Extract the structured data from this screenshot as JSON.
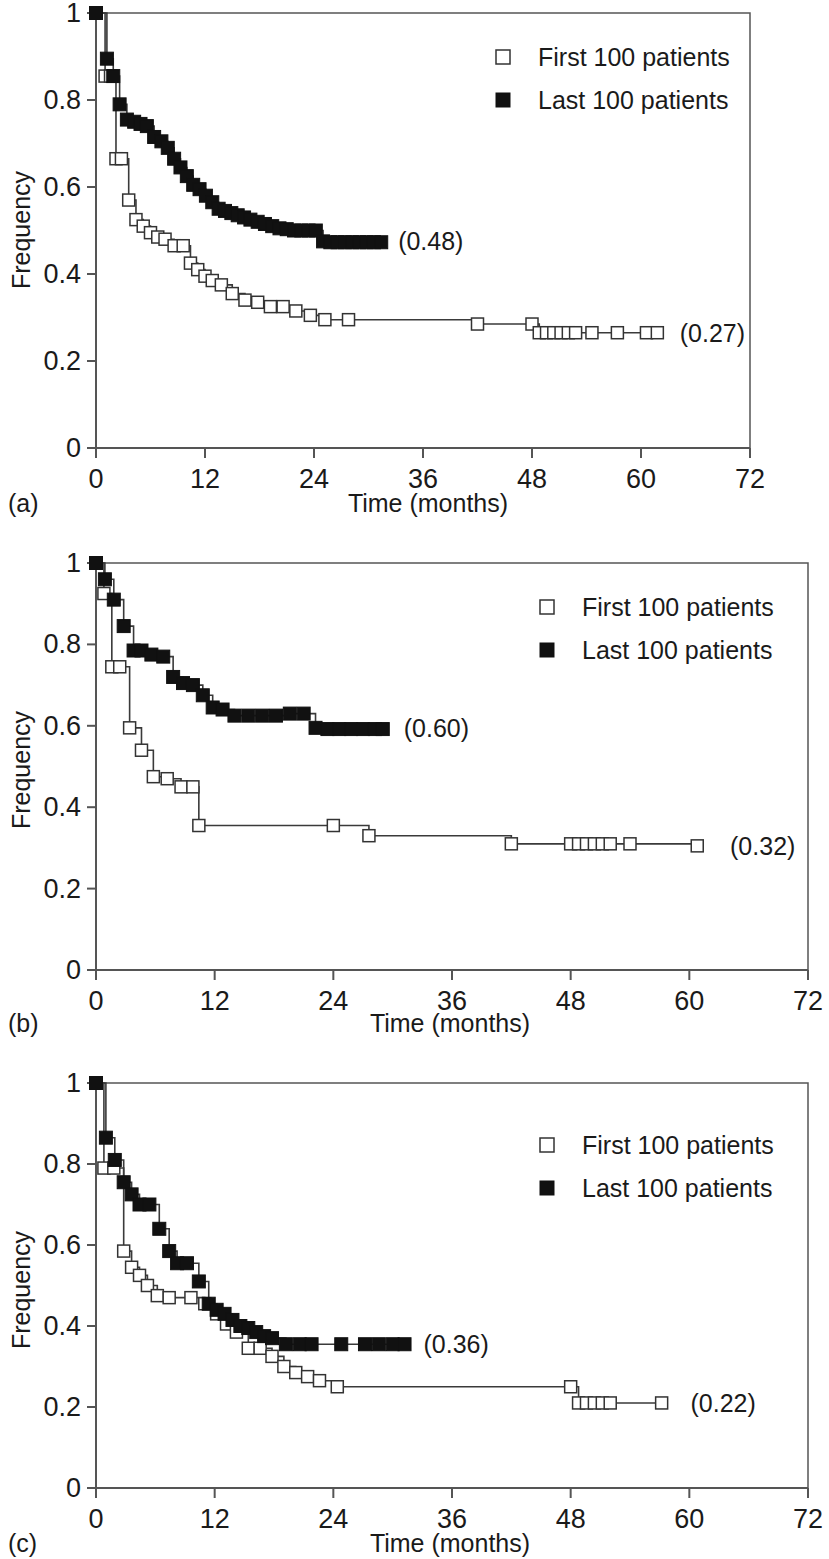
{
  "figure": {
    "type": "kaplan-meier-survival-curves",
    "panel_count": 3
  },
  "common": {
    "ylabel": "Frequency",
    "xlabel": "Time (months)",
    "yticks": [
      "0",
      "0.2",
      "0.4",
      "0.6",
      "0.8",
      "1"
    ],
    "ytick_values": [
      0,
      0.2,
      0.4,
      0.6,
      0.8,
      1
    ],
    "xticks": [
      "0",
      "12",
      "24",
      "36",
      "48",
      "60",
      "72"
    ],
    "xtick_values": [
      0,
      12,
      24,
      36,
      48,
      60,
      72
    ],
    "legend": [
      {
        "label": "First 100 patients",
        "marker": "open-square",
        "color": "#ffffff"
      },
      {
        "label": "Last 100 patients",
        "marker": "filled-square",
        "color": "#111111"
      }
    ],
    "grid": false,
    "legend_position": "top-right"
  },
  "chart_data": [
    {
      "type": "line",
      "panel": "a",
      "caption": "(a)",
      "title": "",
      "xlabel": "Time (months)",
      "ylabel": "Frequency",
      "xlim": [
        0,
        72
      ],
      "ylim": [
        0,
        1
      ],
      "grid": false,
      "legend": [
        "First 100 patients",
        "Last 100 patients"
      ],
      "legend_position": "top-right",
      "annotations": [
        {
          "text": "(0.48)",
          "series": "Last 100 patients",
          "x": 31.5,
          "y": 0.475
        },
        {
          "text": "(0.27)",
          "series": "First 100 patients",
          "x": 62.5,
          "y": 0.265
        }
      ],
      "series": [
        {
          "name": "First 100 patients",
          "marker": "open-square",
          "final_value": 0.27,
          "x": [
            0,
            1.0,
            1.6,
            2.2,
            2.8,
            3.6,
            4.4,
            5.2,
            6.0,
            6.8,
            7.6,
            8.6,
            9.6,
            10.4,
            11.2,
            12.0,
            12.8,
            13.8,
            15.0,
            16.4,
            17.8,
            19.2,
            20.6,
            22.0,
            23.6,
            25.2,
            27.8,
            42.0,
            48.0,
            48.8,
            49.6,
            50.4,
            51.2,
            52.0,
            52.8,
            54.6,
            57.4,
            60.6,
            61.8
          ],
          "y": [
            1.0,
            0.855,
            0.855,
            0.665,
            0.665,
            0.57,
            0.525,
            0.51,
            0.495,
            0.485,
            0.48,
            0.465,
            0.465,
            0.425,
            0.41,
            0.395,
            0.385,
            0.375,
            0.355,
            0.34,
            0.335,
            0.325,
            0.325,
            0.315,
            0.305,
            0.295,
            0.295,
            0.285,
            0.285,
            0.265,
            0.265,
            0.265,
            0.265,
            0.265,
            0.265,
            0.265,
            0.265,
            0.265,
            0.265
          ]
        },
        {
          "name": "Last 100 patients",
          "marker": "filled-square",
          "final_value": 0.48,
          "x": [
            0,
            1.2,
            1.9,
            2.6,
            3.4,
            4.2,
            4.9,
            5.6,
            6.4,
            7.2,
            7.9,
            8.6,
            9.3,
            10.0,
            10.7,
            11.4,
            12.1,
            12.8,
            13.5,
            14.2,
            14.9,
            15.6,
            16.3,
            17.0,
            17.8,
            18.6,
            19.4,
            20.2,
            21.0,
            21.8,
            22.6,
            23.4,
            24.2,
            25.0,
            25.8,
            26.6,
            27.4,
            28.2,
            29.0,
            29.8,
            30.6,
            31.4
          ],
          "y": [
            1.0,
            0.895,
            0.855,
            0.79,
            0.755,
            0.75,
            0.745,
            0.74,
            0.715,
            0.705,
            0.69,
            0.665,
            0.645,
            0.625,
            0.605,
            0.595,
            0.58,
            0.565,
            0.55,
            0.545,
            0.54,
            0.535,
            0.53,
            0.525,
            0.52,
            0.515,
            0.51,
            0.505,
            0.503,
            0.5,
            0.5,
            0.5,
            0.5,
            0.475,
            0.473,
            0.473,
            0.473,
            0.473,
            0.473,
            0.473,
            0.473,
            0.473
          ]
        }
      ]
    },
    {
      "type": "line",
      "panel": "b",
      "caption": "(b)",
      "title": "",
      "xlabel": "Time (months)",
      "ylabel": "Frequency",
      "xlim": [
        0,
        72
      ],
      "ylim": [
        0,
        1
      ],
      "grid": false,
      "legend": [
        "First 100 patients",
        "Last 100 patients"
      ],
      "legend_position": "top-right",
      "annotations": [
        {
          "text": "(0.60)",
          "series": "Last 100 patients",
          "x": 29.5,
          "y": 0.595
        },
        {
          "text": "(0.32)",
          "series": "First 100 patients",
          "x": 62.5,
          "y": 0.305
        }
      ],
      "series": [
        {
          "name": "First 100 patients",
          "marker": "open-square",
          "final_value": 0.32,
          "x": [
            0,
            0.8,
            1.6,
            2.4,
            3.4,
            4.6,
            5.8,
            7.2,
            8.6,
            9.8,
            10.4,
            24.0,
            27.6,
            42.0,
            48.0,
            48.8,
            49.6,
            50.4,
            51.2,
            52.0,
            54.0,
            60.8
          ],
          "y": [
            1.0,
            0.925,
            0.745,
            0.745,
            0.595,
            0.54,
            0.475,
            0.47,
            0.45,
            0.45,
            0.355,
            0.355,
            0.33,
            0.31,
            0.31,
            0.31,
            0.31,
            0.31,
            0.31,
            0.31,
            0.31,
            0.305
          ]
        },
        {
          "name": "Last 100 patients",
          "marker": "filled-square",
          "final_value": 0.6,
          "x": [
            0,
            0.9,
            1.8,
            2.8,
            3.8,
            4.6,
            5.6,
            6.8,
            7.8,
            8.8,
            9.8,
            10.8,
            11.8,
            12.8,
            14.0,
            15.4,
            16.8,
            18.2,
            19.6,
            21.0,
            22.2,
            23.4,
            24.6,
            25.8,
            27.0,
            28.2,
            29.0
          ],
          "y": [
            1.0,
            0.96,
            0.91,
            0.845,
            0.785,
            0.785,
            0.775,
            0.77,
            0.72,
            0.705,
            0.7,
            0.675,
            0.645,
            0.64,
            0.625,
            0.625,
            0.625,
            0.625,
            0.63,
            0.63,
            0.595,
            0.592,
            0.592,
            0.592,
            0.592,
            0.592,
            0.592
          ]
        }
      ]
    },
    {
      "type": "line",
      "panel": "c",
      "caption": "(c)",
      "title": "",
      "xlabel": "Time (months)",
      "ylabel": "Frequency",
      "xlim": [
        0,
        72
      ],
      "ylim": [
        0,
        1
      ],
      "grid": false,
      "legend": [
        "First 100 patients",
        "Last 100 patients"
      ],
      "legend_position": "top-right",
      "annotations": [
        {
          "text": "(0.36)",
          "series": "Last 100 patients",
          "x": 31.5,
          "y": 0.355
        },
        {
          "text": "(0.22)",
          "series": "First 100 patients",
          "x": 58.5,
          "y": 0.21
        }
      ],
      "series": [
        {
          "name": "First 100 patients",
          "marker": "open-square",
          "final_value": 0.22,
          "x": [
            0,
            0.8,
            1.8,
            2.8,
            3.6,
            4.4,
            5.2,
            6.2,
            7.4,
            9.6,
            11.0,
            12.2,
            13.2,
            14.2,
            15.4,
            16.6,
            17.8,
            19.0,
            20.2,
            21.4,
            22.6,
            24.4,
            48.0,
            48.8,
            49.6,
            50.4,
            51.2,
            52.0,
            57.2
          ],
          "y": [
            1.0,
            0.79,
            0.79,
            0.585,
            0.545,
            0.525,
            0.5,
            0.475,
            0.47,
            0.47,
            0.455,
            0.43,
            0.405,
            0.385,
            0.345,
            0.345,
            0.325,
            0.3,
            0.285,
            0.275,
            0.265,
            0.25,
            0.25,
            0.21,
            0.21,
            0.21,
            0.21,
            0.21,
            0.21
          ]
        },
        {
          "name": "Last 100 patients",
          "marker": "filled-square",
          "final_value": 0.36,
          "x": [
            0,
            1.0,
            1.9,
            2.8,
            3.6,
            4.4,
            5.4,
            6.4,
            7.4,
            8.2,
            9.2,
            10.4,
            11.4,
            12.2,
            13.0,
            13.8,
            14.6,
            15.4,
            16.2,
            17.0,
            17.8,
            19.2,
            20.6,
            21.8,
            24.8,
            27.2,
            28.6,
            30.0,
            31.2
          ],
          "y": [
            1.0,
            0.865,
            0.81,
            0.755,
            0.725,
            0.7,
            0.7,
            0.64,
            0.585,
            0.555,
            0.555,
            0.51,
            0.455,
            0.44,
            0.43,
            0.415,
            0.4,
            0.395,
            0.385,
            0.375,
            0.37,
            0.355,
            0.355,
            0.355,
            0.355,
            0.355,
            0.355,
            0.355,
            0.355
          ]
        }
      ]
    }
  ]
}
